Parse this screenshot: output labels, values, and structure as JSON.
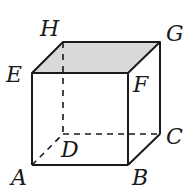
{
  "figure": {
    "type": "cube",
    "top_face_fill": "#d9d9d9",
    "edge_color": "#1a1a1a",
    "vertices": {
      "A": {
        "label": "A",
        "x": 32,
        "y": 165
      },
      "B": {
        "label": "B",
        "x": 128,
        "y": 165
      },
      "C": {
        "label": "C",
        "x": 160,
        "y": 134
      },
      "D": {
        "label": "D",
        "x": 63,
        "y": 134
      },
      "E": {
        "label": "E",
        "x": 32,
        "y": 73
      },
      "F": {
        "label": "F",
        "x": 128,
        "y": 73
      },
      "G": {
        "label": "G",
        "x": 160,
        "y": 42
      },
      "H": {
        "label": "H",
        "x": 63,
        "y": 42
      }
    },
    "hidden_edges": [
      "AD",
      "DC",
      "DH"
    ],
    "shaded_face": "EFGH"
  }
}
